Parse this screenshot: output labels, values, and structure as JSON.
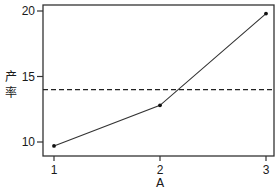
{
  "chart_data": {
    "type": "line",
    "title": "",
    "xlabel": "A",
    "ylabel": "产率",
    "ylabel_chars": [
      "产",
      "率"
    ],
    "x": [
      1,
      2,
      3
    ],
    "categories": [
      "1",
      "2",
      "3"
    ],
    "series": [
      {
        "name": "产率",
        "values": [
          9.7,
          12.8,
          19.8
        ],
        "style": "solid",
        "marker": "dot",
        "color": "#333333"
      }
    ],
    "reference_lines": [
      {
        "orientation": "horizontal",
        "value": 14.0,
        "style": "dashed",
        "color": "#222222",
        "label": "mean"
      }
    ],
    "xticks": [
      "1",
      "2",
      "3"
    ],
    "yticks": [
      "10",
      "15",
      "20"
    ],
    "ylim": [
      9.0,
      20.6
    ],
    "xlim": [
      0.9,
      3.1
    ],
    "grid": false,
    "legend": null
  },
  "ui": {
    "frame_color": "#333333",
    "text_color": "#1a1a1a"
  }
}
